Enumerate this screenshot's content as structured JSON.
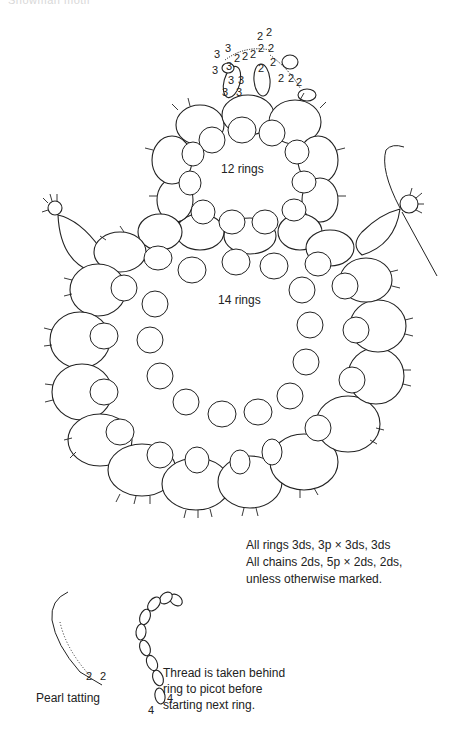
{
  "header": {
    "cropped_title": "Snowman motif"
  },
  "diagram": {
    "head": {
      "label": "12 rings",
      "ring_count": 12
    },
    "body": {
      "label": "14 rings",
      "ring_count": 14
    },
    "hat_stitch_counts": [
      "3",
      "3",
      "3",
      "3",
      "3",
      "3",
      "3",
      "3",
      "2",
      "2",
      "2",
      "2",
      "2",
      "2",
      "2",
      "2",
      "2",
      "2",
      "2",
      "2",
      "2",
      "2"
    ],
    "pearl_tatting_counts": [
      "2",
      "2"
    ],
    "chain_sample_counts": [
      "4",
      "4"
    ]
  },
  "notes": {
    "lines": [
      "All rings 3ds, 3p × 3ds, 3ds",
      "All chains 2ds, 5p × 2ds, 2ds,",
      "unless otherwise marked."
    ]
  },
  "captions": {
    "pearl_tatting": "Pearl tatting",
    "thread_note": [
      "Thread is taken behind",
      "ring to picot before",
      "starting next ring."
    ]
  }
}
